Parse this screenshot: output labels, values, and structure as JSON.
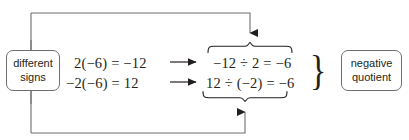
{
  "diagram": {
    "stroke_color": "#6d6e71",
    "text_color": "#231f20",
    "background": "#ffffff",
    "nodes": {
      "condition": {
        "name": "different-signs",
        "line1": "different",
        "line2": "signs"
      },
      "result": {
        "name": "negative-quotient",
        "line1": "negative",
        "line2": "quotient"
      }
    },
    "rows": [
      {
        "multiplication": "2(−6) = −12",
        "arrow": "⟶",
        "division": "−12 ÷ 2 = −6",
        "brace": "overbrace",
        "brace_target": "−12 ÷ 2"
      },
      {
        "multiplication": "−2(−6) = 12",
        "arrow": "⟶",
        "division": "12 ÷ (−2) = −6",
        "brace": "underbrace",
        "brace_target": "12 ÷ (−2)"
      }
    ],
    "group_brace": "}",
    "connectors": [
      {
        "name": "top-feedback-rail",
        "from": "different-signs",
        "to": "overbrace",
        "arrow": "down"
      },
      {
        "name": "bottom-feedback-rail",
        "from": "different-signs",
        "to": "underbrace",
        "arrow": "up"
      }
    ]
  }
}
